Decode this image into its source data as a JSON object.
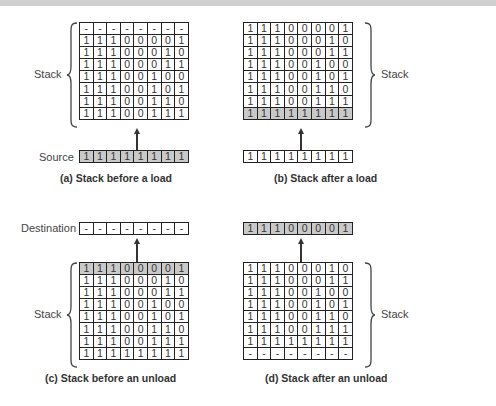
{
  "panels": {
    "a": {
      "caption": "(a) Stack before a load",
      "stack_label": "Stack",
      "register_label": "Source",
      "stack": [
        [
          "-",
          "-",
          "-",
          "-",
          "-",
          "-",
          "-",
          "-"
        ],
        [
          "1",
          "1",
          "1",
          "0",
          "0",
          "0",
          "0",
          "1"
        ],
        [
          "1",
          "1",
          "1",
          "0",
          "0",
          "0",
          "1",
          "0"
        ],
        [
          "1",
          "1",
          "1",
          "0",
          "0",
          "0",
          "1",
          "1"
        ],
        [
          "1",
          "1",
          "1",
          "0",
          "0",
          "1",
          "0",
          "0"
        ],
        [
          "1",
          "1",
          "1",
          "0",
          "0",
          "1",
          "0",
          "1"
        ],
        [
          "1",
          "1",
          "1",
          "0",
          "0",
          "1",
          "1",
          "0"
        ],
        [
          "1",
          "1",
          "1",
          "0",
          "0",
          "1",
          "1",
          "1"
        ]
      ],
      "register": [
        "1",
        "1",
        "1",
        "1",
        "1",
        "1",
        "1",
        "1"
      ],
      "register_shaded": true
    },
    "b": {
      "caption": "(b) Stack after a load",
      "stack_label": "Stack",
      "stack": [
        [
          "1",
          "1",
          "1",
          "0",
          "0",
          "0",
          "0",
          "1"
        ],
        [
          "1",
          "1",
          "1",
          "0",
          "0",
          "0",
          "1",
          "0"
        ],
        [
          "1",
          "1",
          "1",
          "0",
          "0",
          "0",
          "1",
          "1"
        ],
        [
          "1",
          "1",
          "1",
          "0",
          "0",
          "1",
          "0",
          "0"
        ],
        [
          "1",
          "1",
          "1",
          "0",
          "0",
          "1",
          "0",
          "1"
        ],
        [
          "1",
          "1",
          "1",
          "0",
          "0",
          "1",
          "1",
          "0"
        ],
        [
          "1",
          "1",
          "1",
          "0",
          "0",
          "1",
          "1",
          "1"
        ],
        [
          "1",
          "1",
          "1",
          "1",
          "1",
          "1",
          "1",
          "1"
        ]
      ],
      "shaded_row": 7,
      "register": [
        "1",
        "1",
        "1",
        "1",
        "1",
        "1",
        "1",
        "1"
      ],
      "register_shaded": false
    },
    "c": {
      "caption": "(c) Stack before an unload",
      "stack_label": "Stack",
      "register_label": "Destination",
      "register": [
        "-",
        "-",
        "-",
        "-",
        "-",
        "-",
        "-",
        "-"
      ],
      "register_shaded": false,
      "stack": [
        [
          "1",
          "1",
          "1",
          "0",
          "0",
          "0",
          "0",
          "1"
        ],
        [
          "1",
          "1",
          "1",
          "0",
          "0",
          "0",
          "1",
          "0"
        ],
        [
          "1",
          "1",
          "1",
          "0",
          "0",
          "0",
          "1",
          "1"
        ],
        [
          "1",
          "1",
          "1",
          "0",
          "0",
          "1",
          "0",
          "0"
        ],
        [
          "1",
          "1",
          "1",
          "0",
          "0",
          "1",
          "0",
          "1"
        ],
        [
          "1",
          "1",
          "1",
          "0",
          "0",
          "1",
          "1",
          "0"
        ],
        [
          "1",
          "1",
          "1",
          "0",
          "0",
          "1",
          "1",
          "1"
        ],
        [
          "1",
          "1",
          "1",
          "1",
          "1",
          "1",
          "1",
          "1"
        ]
      ],
      "shaded_row": 0
    },
    "d": {
      "caption": "(d) Stack after an unload",
      "stack_label": "Stack",
      "register": [
        "1",
        "1",
        "1",
        "0",
        "0",
        "0",
        "0",
        "1"
      ],
      "register_shaded": true,
      "stack": [
        [
          "1",
          "1",
          "1",
          "0",
          "0",
          "0",
          "1",
          "0"
        ],
        [
          "1",
          "1",
          "1",
          "0",
          "0",
          "0",
          "1",
          "1"
        ],
        [
          "1",
          "1",
          "1",
          "0",
          "0",
          "1",
          "0",
          "0"
        ],
        [
          "1",
          "1",
          "1",
          "0",
          "0",
          "1",
          "0",
          "1"
        ],
        [
          "1",
          "1",
          "1",
          "0",
          "0",
          "1",
          "1",
          "0"
        ],
        [
          "1",
          "1",
          "1",
          "0",
          "0",
          "1",
          "1",
          "1"
        ],
        [
          "1",
          "1",
          "1",
          "1",
          "1",
          "1",
          "1",
          "1"
        ],
        [
          "-",
          "-",
          "-",
          "-",
          "-",
          "-",
          "-",
          "-"
        ]
      ]
    }
  },
  "colors": {
    "shaded_cell": "#c9c9c9",
    "grid_line": "#222222"
  }
}
